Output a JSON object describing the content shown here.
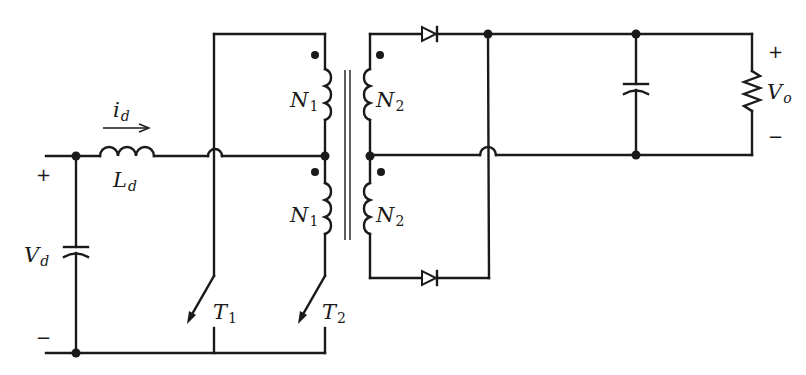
{
  "diagram": {
    "type": "push-pull converter schematic",
    "labels": {
      "current": {
        "main": "i",
        "sub": "d"
      },
      "inductor": {
        "main": "L",
        "sub": "d"
      },
      "source": {
        "main": "V",
        "sub": "d"
      },
      "switch1": {
        "main": "T",
        "sub": "1"
      },
      "switch2": {
        "main": "T",
        "sub": "2"
      },
      "primary_top": {
        "main": "N",
        "sub": "1"
      },
      "primary_bottom": {
        "main": "N",
        "sub": "1"
      },
      "secondary_top": {
        "main": "N",
        "sub": "2"
      },
      "secondary_bottom": {
        "main": "N",
        "sub": "2"
      },
      "output": {
        "main": "V",
        "sub": "o"
      }
    },
    "signs": {
      "input_plus": "+",
      "input_minus": "−",
      "output_plus": "+",
      "output_minus": "−"
    },
    "components": [
      "input-capacitor",
      "input-inductor",
      "switch-T1",
      "switch-T2",
      "primary-winding-top",
      "primary-winding-bottom",
      "transformer-core",
      "secondary-winding-top",
      "secondary-winding-bottom",
      "diode-top",
      "diode-bottom",
      "output-capacitor",
      "load-resistor"
    ],
    "colors": {
      "ink": "#1a1a1a",
      "background": "#ffffff"
    }
  }
}
